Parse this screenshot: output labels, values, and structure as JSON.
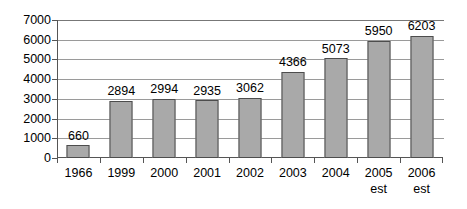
{
  "chart_data": {
    "type": "bar",
    "title": "",
    "subtitle": "",
    "xlabel": "",
    "ylabel": "",
    "categories": [
      "1966",
      "1999",
      "2000",
      "2001",
      "2002",
      "2003",
      "2004",
      "2005 est",
      "2006 est"
    ],
    "category_lines": [
      [
        "1966",
        ""
      ],
      [
        "1999",
        ""
      ],
      [
        "2000",
        ""
      ],
      [
        "2001",
        ""
      ],
      [
        "2002",
        ""
      ],
      [
        "2003",
        ""
      ],
      [
        "2004",
        ""
      ],
      [
        "2005",
        "est"
      ],
      [
        "2006",
        "est"
      ]
    ],
    "values": [
      660,
      2894,
      2994,
      2935,
      3062,
      4366,
      5073,
      5950,
      6203
    ],
    "data_labels": [
      "660",
      "2894",
      "2994",
      "2935",
      "3062",
      "4366",
      "5073",
      "5950",
      "6203"
    ],
    "ylim": [
      0,
      7000
    ],
    "yticks": [
      0,
      1000,
      2000,
      3000,
      4000,
      5000,
      6000,
      7000
    ],
    "ytick_labels": [
      "0",
      "1000",
      "2000",
      "3000",
      "4000",
      "5000",
      "6000",
      "7000"
    ],
    "grid": true,
    "grid_axis": "y",
    "legend": false,
    "legend_position": "none",
    "bar_color": "#a9a9a9",
    "bar_border_color": "#4d4d4d",
    "gridline_color": "#9a9a9a",
    "axis_color": "#555555",
    "background_color": "#ffffff",
    "text_color": "#000000"
  }
}
